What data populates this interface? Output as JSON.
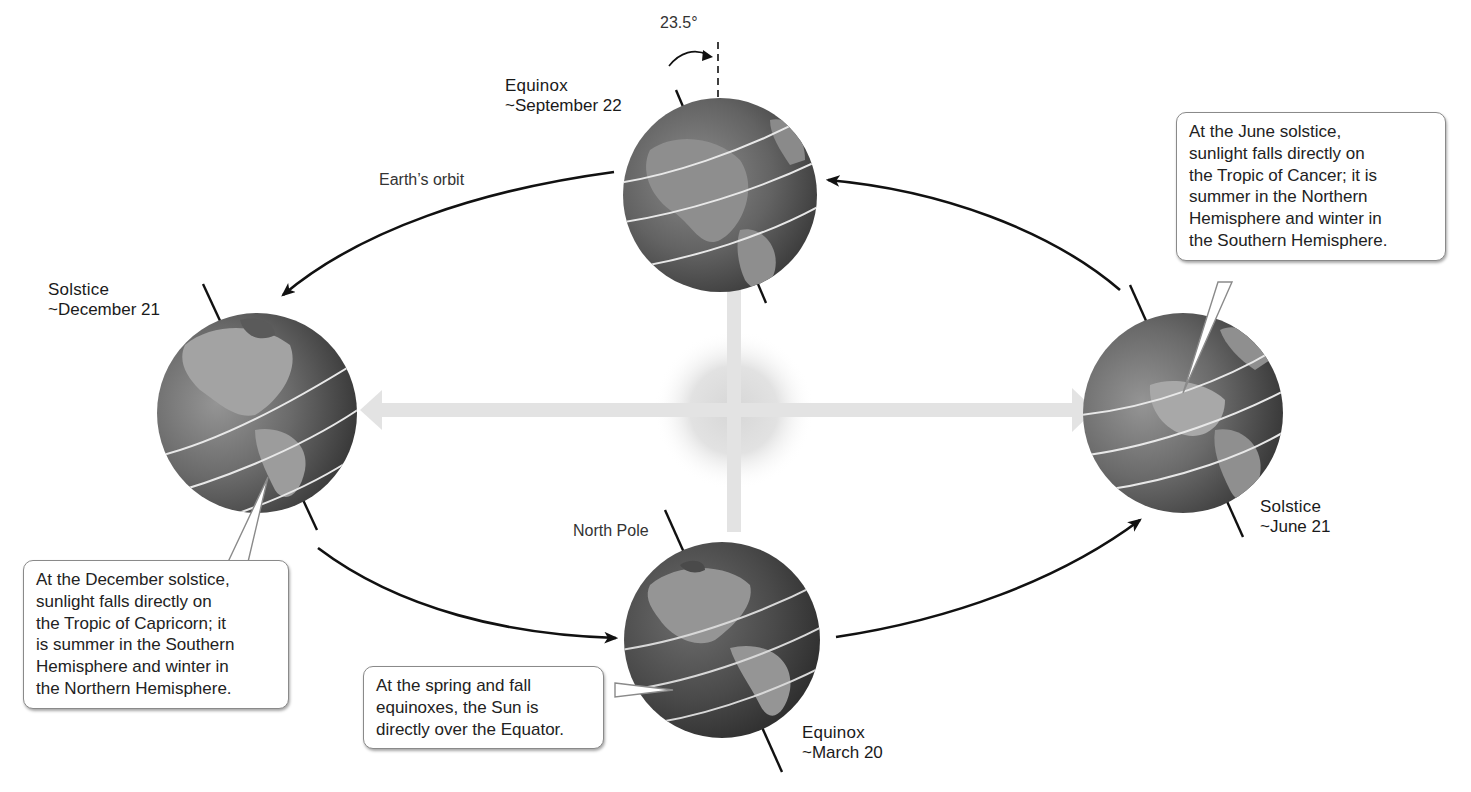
{
  "diagram": {
    "labels": {
      "orbit": "Earth’s orbit",
      "north_pole": "North Pole",
      "tilt_angle": "23.5°"
    },
    "positions": [
      {
        "id": "september",
        "name": "Equinox",
        "date": "~September 22"
      },
      {
        "id": "december",
        "name": "Solstice",
        "date": "~December 21"
      },
      {
        "id": "march",
        "name": "Equinox",
        "date": "~March 20"
      },
      {
        "id": "june",
        "name": "Solstice",
        "date": "~June 21"
      }
    ],
    "callouts": {
      "june": {
        "lines": [
          "At the June solstice,",
          "sunlight falls directly on",
          "the Tropic of Cancer; it is",
          "summer in the Northern",
          "Hemisphere and winter in",
          "the Southern Hemisphere."
        ]
      },
      "december": {
        "lines": [
          "At the December solstice,",
          "sunlight falls directly on",
          "the Tropic of Capricorn; it",
          "is summer in the Southern",
          "Hemisphere and winter in",
          "the Northern Hemisphere."
        ]
      },
      "equinox": {
        "lines": [
          "At the spring and fall",
          "equinoxes, the Sun is",
          "directly over the Equator."
        ]
      }
    },
    "colors": {
      "background": "#ffffff",
      "globe_ocean": "#5a5a5a",
      "globe_land": "#9a9a9a",
      "sunlight_arrow": "#e3e3e3",
      "sun_glow": "#dcdcdc",
      "orbit_arrow": "#111111",
      "latitude_line": "#e8e8e8"
    }
  }
}
